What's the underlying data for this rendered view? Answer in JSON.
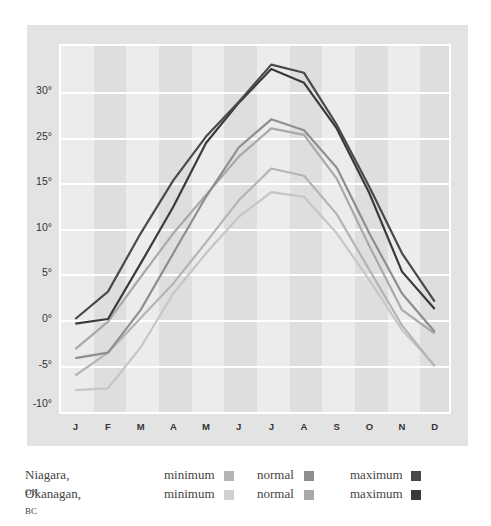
{
  "chart_data": {
    "type": "line",
    "title": "",
    "xlabel": "",
    "ylabel": "",
    "categories": [
      "J",
      "F",
      "M",
      "A",
      "M",
      "J",
      "J",
      "A",
      "S",
      "O",
      "N",
      "D"
    ],
    "y_tick_labels": [
      "30°",
      "25°",
      "15°",
      "10°",
      "5°",
      "0°",
      "-5°",
      "-10°"
    ],
    "ylim": [
      -10,
      35
    ],
    "grid": true,
    "series": [
      {
        "name": "Niagara, ON maximum",
        "color": "#4a4a4a",
        "values": [
          0,
          3,
          9.4,
          15.2,
          20,
          23.8,
          27.9,
          27,
          21.3,
          14.5,
          7.2,
          1.9
        ]
      },
      {
        "name": "Okanagan, BC maximum",
        "color": "#3a3a3a",
        "values": [
          -0.5,
          0,
          6.1,
          12.3,
          19.3,
          23.7,
          27.4,
          25.9,
          20.9,
          13.8,
          5.2,
          1.1
        ]
      },
      {
        "name": "Niagara, ON normal",
        "color": "#8e8e8e",
        "values": [
          -4.3,
          -3.7,
          1,
          7.2,
          13.4,
          18.8,
          21.9,
          20.7,
          16.6,
          9.4,
          2.8,
          -1.4
        ]
      },
      {
        "name": "Okanagan, BC normal",
        "color": "#a9a9a9",
        "values": [
          -3.3,
          -0.3,
          4.6,
          9.4,
          13.6,
          17.8,
          20.9,
          20.2,
          15.4,
          8,
          1,
          -1.6
        ]
      },
      {
        "name": "Niagara, ON minimum",
        "color": "#b4b4b4",
        "values": [
          -6.2,
          -3.7,
          0.1,
          3.9,
          8.4,
          13,
          16.5,
          15.7,
          11.5,
          5.4,
          -0.7,
          -5.2
        ]
      },
      {
        "name": "Okanagan, BC minimum",
        "color": "#c6c6c6",
        "values": [
          -7.8,
          -7.6,
          -3.1,
          2.8,
          7.2,
          11.2,
          13.9,
          13.4,
          9.4,
          4.3,
          -1.2,
          -5.1
        ]
      }
    ],
    "legend_position": "bottom"
  },
  "legend": {
    "rows": [
      {
        "place": "Niagara,",
        "region": "on",
        "items": [
          {
            "label": "minimum",
            "color": "#b4b4b4"
          },
          {
            "label": "normal",
            "color": "#8e8e8e"
          },
          {
            "label": "maximum",
            "color": "#4a4a4a"
          }
        ]
      },
      {
        "place": "Okanagan,",
        "region": "bc",
        "items": [
          {
            "label": "minimum",
            "color": "#cfcfcf"
          },
          {
            "label": "normal",
            "color": "#a9a9a9"
          },
          {
            "label": "maximum",
            "color": "#3a3a3a"
          }
        ]
      }
    ]
  }
}
